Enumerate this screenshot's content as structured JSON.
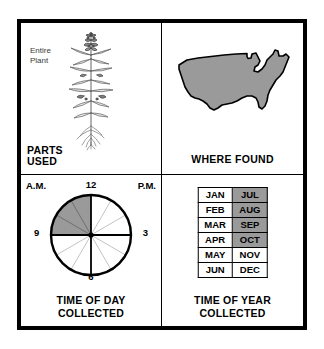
{
  "card": {
    "quadrants": {
      "parts_used": {
        "caption": "PARTS\nUSED",
        "detail_label": "Entire\nPlant",
        "illustration_name": "entire-plant-illustration"
      },
      "where_found": {
        "caption": "WHERE FOUND",
        "illustration_name": "united-states-map"
      },
      "time_of_day": {
        "caption": "TIME OF DAY\nCOLLECTED",
        "am_label": "A.M.",
        "pm_label": "P.M.",
        "hour_top": "12",
        "hour_right": "3",
        "hour_bottom": "6",
        "hour_left": "9",
        "shaded_range": "9 A.M. to 12 P.M.",
        "shaded_start_hour": 9,
        "shaded_end_hour": 12,
        "total_hour_spokes": 12
      },
      "time_of_year": {
        "caption": "TIME OF YEAR\nCOLLECTED",
        "months_left_column": [
          "JAN",
          "FEB",
          "MAR",
          "APR",
          "MAY",
          "JUN"
        ],
        "months_right_column": [
          "JUL",
          "AUG",
          "SEP",
          "OCT",
          "NOV",
          "DEC"
        ],
        "shaded_months": [
          "JUL",
          "AUG",
          "SEP",
          "OCT"
        ],
        "rows": [
          {
            "left": "JAN",
            "left_shaded": false,
            "right": "JUL",
            "right_shaded": true
          },
          {
            "left": "FEB",
            "left_shaded": false,
            "right": "AUG",
            "right_shaded": true
          },
          {
            "left": "MAR",
            "left_shaded": false,
            "right": "SEP",
            "right_shaded": true
          },
          {
            "left": "APR",
            "left_shaded": false,
            "right": "OCT",
            "right_shaded": true
          },
          {
            "left": "MAY",
            "left_shaded": false,
            "right": "NOV",
            "right_shaded": false
          },
          {
            "left": "JUN",
            "left_shaded": false,
            "right": "DEC",
            "right_shaded": false
          }
        ]
      }
    }
  },
  "colors": {
    "shade_gray": "#9a9a9a",
    "ink_black": "#000000",
    "paper_white": "#ffffff",
    "label_gray": "#3a3a3a"
  }
}
